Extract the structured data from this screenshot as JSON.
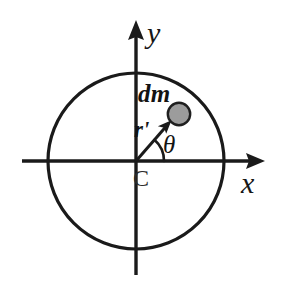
{
  "figure": {
    "background_color": "#ffffff",
    "stroke_color": "#1a1a1a",
    "width": 291,
    "height": 292
  },
  "axes": {
    "x_axis": {
      "label": "x",
      "icon": "arrow-right-icon",
      "start_x": 22,
      "end_x": 265,
      "y": 161
    },
    "y_axis": {
      "label": "y",
      "icon": "arrow-up-icon",
      "start_y": 275,
      "end_y": 20,
      "x": 136
    }
  },
  "disc": {
    "name": "disc-outline",
    "center_label": "C",
    "center_x": 136,
    "center_y": 161,
    "radius": 88,
    "stroke_color": "#1a1a1a",
    "stroke_width": 3,
    "fill": "none"
  },
  "mass_element": {
    "label": "dm",
    "fill_color": "#9c9c9c",
    "stroke_color": "#1f1f1f",
    "center_x": 179,
    "center_y": 114,
    "radius": 11
  },
  "radius_vector": {
    "label": "r'",
    "icon": "arrow-up-right-icon",
    "from_x": 136,
    "from_y": 161,
    "to_x": 170,
    "to_y": 122
  },
  "angle": {
    "label": "θ",
    "arc_radius": 28,
    "start_deg": 0,
    "end_deg": 49
  }
}
